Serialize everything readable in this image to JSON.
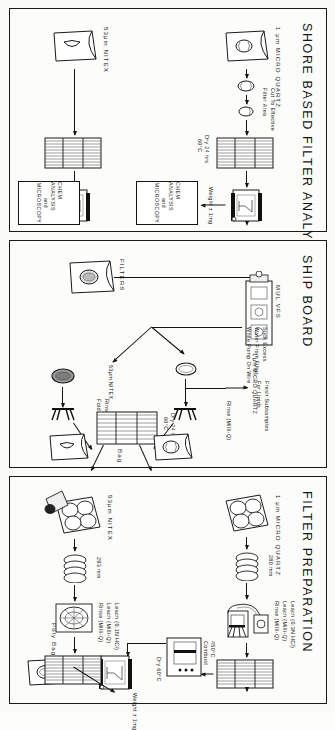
{
  "figure": {
    "type": "flowchart",
    "orientation": "rotated-90",
    "panels": [
      {
        "id": "shore",
        "title": "SHORE  BASED  FILTER  ANALYSIS",
        "rows": [
          {
            "source_label": "1 μm MICRO QUARTZ",
            "steps": [
              "Cut To Effective",
              "Filter Area",
              "Dry 24 hrs\n60°C",
              "Weight ± 1mg"
            ],
            "terminal": "CHEM ANALYSIS\nand\nMICROSCOPY"
          },
          {
            "source_label": "53μm NITEX",
            "steps": [
              "Dry 24 hrs\n60°C",
              "Weight ± 1mg"
            ],
            "terminal": "CHEM ANALYSIS\nand\nMICROSCOPY"
          }
        ],
        "labels": {
          "cut_to_effective": "Cut To Effective",
          "filter_area": "Filter Area",
          "dry": "Dry 24 hrs",
          "dry_temp": "60°C",
          "weigh": "Weight ± 1mg",
          "chem1_l1": "CHEM ANALYSIS",
          "chem1_l2": "and",
          "chem1_l3": "MICROSCOPY",
          "chem2_l1": "CHEM ANALYSIS",
          "chem2_l2": "and",
          "chem2_l3": "MICROSCOPY",
          "src_quartz": "1 μm MICRO QUARTZ",
          "src_nitex": "53μm NITEX"
        }
      },
      {
        "id": "ship",
        "title": "SHIP  BOARD",
        "labels": {
          "filters": "FILTERS",
          "mulvfs": "MUL VFS",
          "suck_l1": "Suck Excess",
          "suck_l2": "Water From Filter",
          "suck_l3": "While Pump On Wire",
          "quartz": "1 μm MICRO QUARTZ",
          "nitex": "53μm NITEX",
          "fresh_l1": "Fresh Subsamples",
          "fresh_l2": "For Lipids",
          "rinse_top": "Rinse (Milli-Q)",
          "rinse_bot_l1": "Rinse (Milli - Q)",
          "rinse_bot_l2": "Fold",
          "dry_l1": "Dry 24 hrs",
          "dry_l2": "60°C",
          "bag": "Bag"
        }
      },
      {
        "id": "prep",
        "title": "FILTER  PREPARATION",
        "labels": {
          "src_quartz": "1 μm MICRO QUARTZ",
          "src_nitex": "53μm NITEX",
          "dia_quartz": "280 mm",
          "dia_nitex": "293 mm",
          "leach_q_l1": "Leach (0.3N HCl)",
          "leach_q_l2": "Leach (Milli-Q)",
          "leach_q_l3": "Rinse (Milli-Q)",
          "leach_n_l1": "Leach (0.1N HCl)",
          "leach_n_l2": "Leach (Milli-Q)",
          "leach_n_l3": "Rinse (Milli-Q)",
          "dry": "Dry 60°C",
          "combust_l1": "450°C",
          "combust_l2": "Combust",
          "weigh": "Weight ± 1mg",
          "polybag": "Poly Bag"
        }
      }
    ],
    "colors": {
      "ink": "#151515",
      "paper": "#fcfcfa",
      "border": "#1a1a1a"
    }
  }
}
